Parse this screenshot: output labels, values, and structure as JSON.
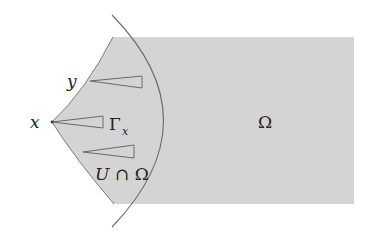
{
  "diagram": {
    "colors": {
      "domain_fill": "#d4d4d4",
      "stroke": "#6a6a6a",
      "text": "#222222",
      "background": "#ffffff"
    },
    "labels": {
      "omega": "Ω",
      "point_x": "x",
      "point_y": "y",
      "gamma": "Γ",
      "gamma_sub": "x",
      "neighborhood_U": "U",
      "intersect": "∩ Ω"
    },
    "elements": [
      "shaded domain Ω with cusp at point x",
      "circular arc boundary of neighborhood U",
      "cone at y",
      "cone Γ_x at x",
      "lower cone"
    ]
  }
}
